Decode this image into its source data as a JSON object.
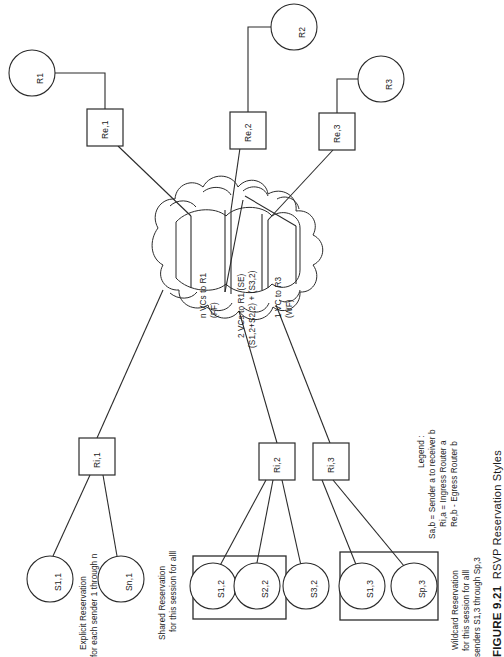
{
  "figure": {
    "caption_number": "FIGURE 9.21",
    "caption_title": "RSVP Reservation Styles"
  },
  "receivers": [
    {
      "id": "r1",
      "label": "R1"
    },
    {
      "id": "r2",
      "label": "R2"
    },
    {
      "id": "r3",
      "label": "R3"
    }
  ],
  "egress_routers": [
    {
      "id": "re1",
      "label": "Re,1"
    },
    {
      "id": "re2",
      "label": "Re,2"
    },
    {
      "id": "re3",
      "label": "Re,3"
    }
  ],
  "ingress_routers": [
    {
      "id": "ri1",
      "label": "Ri,1"
    },
    {
      "id": "ri2",
      "label": "Ri,2"
    },
    {
      "id": "ri3",
      "label": "Ri,3"
    }
  ],
  "senders": [
    {
      "id": "s11",
      "label": "S1,1"
    },
    {
      "id": "sn1",
      "label": "Sn,1"
    },
    {
      "id": "s12",
      "label": "S1,2"
    },
    {
      "id": "s22",
      "label": "S2,2"
    },
    {
      "id": "s32",
      "label": "S3,2"
    },
    {
      "id": "s13",
      "label": "S1,3"
    },
    {
      "id": "sp3",
      "label": "Sp,3"
    }
  ],
  "network_cloud": {
    "name": "network-cloud"
  },
  "vc_flows": [
    {
      "id": "ff",
      "line1": "n VCs to R1",
      "line2": "(FF)",
      "line3": ""
    },
    {
      "id": "se",
      "line1": "2 VCs to R1 (SE)",
      "line2": "(S1,2+S2,2) + (S3,2)",
      "line3": ""
    },
    {
      "id": "wf",
      "line1": "1 VC to R3",
      "line2": "(WF)",
      "line3": ""
    }
  ],
  "annotations": [
    {
      "id": "explicit",
      "line1": "Explicit Reservation",
      "line2": "for each sender 1 through n"
    },
    {
      "id": "shared",
      "line1": "Shared Reservation",
      "line2": "for S1,2 and S2,2"
    },
    {
      "id": "wildcard",
      "line1": "Wildcard Reservation",
      "line2": "for this session for alll",
      "line3": "senders S1,3 through Sp,3"
    }
  ],
  "legend": {
    "title": "Legend :",
    "entries": [
      "Sa,b = Sender a to receiver b",
      "Ri,a = Ingress Router a",
      "Re,b - Egress Router b"
    ]
  },
  "colors": {
    "stroke": "#2b2b2b",
    "text": "#1a1a1a",
    "background": "#ffffff"
  }
}
